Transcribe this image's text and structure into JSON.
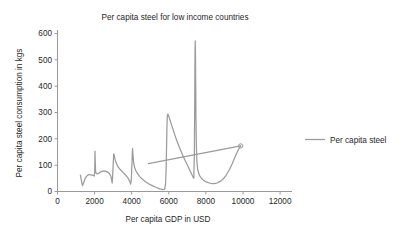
{
  "chart_data": {
    "type": "line",
    "title": "Per capita steel for low income countries",
    "xlabel": "Per capita GDP in USD",
    "ylabel": "Per capita steel consumption in kgs",
    "xlim": [
      0,
      12800
    ],
    "ylim": [
      0,
      620
    ],
    "xticks": [
      0,
      2000,
      4000,
      6000,
      8000,
      10000,
      12000
    ],
    "xtick_labels": [
      "0",
      "2000",
      "4000",
      "6000",
      "8000",
      "10000",
      "12000"
    ],
    "yticks": [
      0,
      100,
      200,
      300,
      400,
      500,
      600
    ],
    "ytick_labels": [
      "0",
      "100",
      "200",
      "300",
      "400",
      "500",
      "600"
    ],
    "grid": false,
    "legend_position": "right",
    "series": [
      {
        "name": "Per capita steel",
        "color": "#9b9b9b",
        "points": [
          [
            1250,
            62
          ],
          [
            1310,
            40
          ],
          [
            1360,
            22
          ],
          [
            1430,
            33
          ],
          [
            1500,
            48
          ],
          [
            1580,
            57
          ],
          [
            1660,
            62
          ],
          [
            1740,
            64
          ],
          [
            1820,
            63
          ],
          [
            1900,
            62
          ],
          [
            1960,
            60
          ],
          [
            2000,
            58
          ],
          [
            2030,
            72
          ],
          [
            2048,
            152
          ],
          [
            2062,
            110
          ],
          [
            2080,
            74
          ],
          [
            2120,
            68
          ],
          [
            2180,
            66
          ],
          [
            2250,
            69
          ],
          [
            2330,
            73
          ],
          [
            2420,
            76
          ],
          [
            2520,
            78
          ],
          [
            2620,
            77
          ],
          [
            2720,
            74
          ],
          [
            2820,
            69
          ],
          [
            2900,
            60
          ],
          [
            2950,
            47
          ],
          [
            2985,
            32
          ],
          [
            3010,
            58
          ],
          [
            3040,
            104
          ],
          [
            3070,
            142
          ],
          [
            3100,
            136
          ],
          [
            3140,
            122
          ],
          [
            3200,
            108
          ],
          [
            3280,
            96
          ],
          [
            3380,
            86
          ],
          [
            3490,
            78
          ],
          [
            3600,
            70
          ],
          [
            3720,
            62
          ],
          [
            3840,
            52
          ],
          [
            3930,
            40
          ],
          [
            3990,
            28
          ],
          [
            4030,
            44
          ],
          [
            4060,
            96
          ],
          [
            4085,
            150
          ],
          [
            4100,
            162
          ],
          [
            4120,
            140
          ],
          [
            4150,
            112
          ],
          [
            4200,
            92
          ],
          [
            4280,
            78
          ],
          [
            4380,
            66
          ],
          [
            4500,
            55
          ],
          [
            4650,
            45
          ],
          [
            4820,
            36
          ],
          [
            5000,
            28
          ],
          [
            5200,
            21
          ],
          [
            5400,
            15
          ],
          [
            5600,
            10
          ],
          [
            5750,
            7
          ],
          [
            5850,
            9
          ],
          [
            5900,
            30
          ],
          [
            5930,
            90
          ],
          [
            5955,
            175
          ],
          [
            5975,
            248
          ],
          [
            5995,
            285
          ],
          [
            6020,
            292
          ],
          [
            6060,
            286
          ],
          [
            6130,
            272
          ],
          [
            6230,
            250
          ],
          [
            6360,
            222
          ],
          [
            6520,
            190
          ],
          [
            6700,
            158
          ],
          [
            6900,
            126
          ],
          [
            7100,
            98
          ],
          [
            7250,
            76
          ],
          [
            7370,
            58
          ],
          [
            7440,
            50
          ],
          [
            7470,
            140
          ],
          [
            7490,
            330
          ],
          [
            7505,
            500
          ],
          [
            7518,
            568
          ],
          [
            7530,
            520
          ],
          [
            7545,
            400
          ],
          [
            7560,
            268
          ],
          [
            7580,
            170
          ],
          [
            7610,
            110
          ],
          [
            7660,
            80
          ],
          [
            7740,
            62
          ],
          [
            7850,
            50
          ],
          [
            7990,
            41
          ],
          [
            8150,
            35
          ],
          [
            8330,
            31
          ],
          [
            8520,
            30
          ],
          [
            8700,
            32
          ],
          [
            8880,
            38
          ],
          [
            9050,
            48
          ],
          [
            9220,
            63
          ],
          [
            9380,
            82
          ],
          [
            9530,
            104
          ],
          [
            9670,
            127
          ],
          [
            9790,
            146
          ],
          [
            9890,
            160
          ],
          [
            9960,
            168
          ],
          [
            10000,
            172
          ]
        ]
      },
      {
        "name": "trend-segment",
        "color": "#9b9b9b",
        "points": [
          [
            4960,
            105
          ],
          [
            10000,
            172
          ]
        ]
      }
    ],
    "end_marker": {
      "x": 10000,
      "y": 172
    }
  },
  "legend": {
    "entries": [
      {
        "label": "Per capita steel"
      }
    ]
  }
}
